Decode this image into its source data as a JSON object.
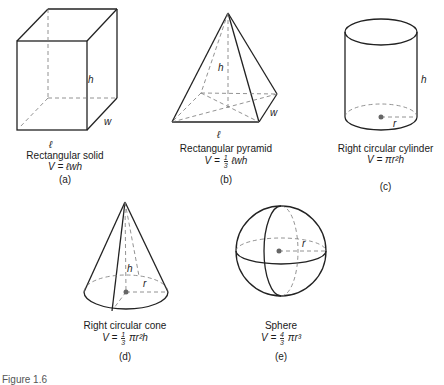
{
  "figure_caption": "Figure 1.6",
  "shapes": [
    {
      "id": "a",
      "name": "Rectangular solid",
      "formula": "V = ℓwh",
      "tag": "(a)",
      "dims": {
        "h": "h",
        "w": "w",
        "l": "ℓ"
      }
    },
    {
      "id": "b",
      "name": "Rectangular pyramid",
      "formula_prefix": "V =",
      "frac_num": "1",
      "frac_den": "3",
      "formula_suffix": "ℓwh",
      "tag": "(b)",
      "dims": {
        "h": "h",
        "w": "w",
        "l": "ℓ"
      }
    },
    {
      "id": "c",
      "name": "Right circular cylinder",
      "formula": "V = πr²h",
      "tag": "(c)",
      "dims": {
        "h": "h",
        "r": "r"
      }
    },
    {
      "id": "d",
      "name": "Right circular cone",
      "formula_prefix": "V =",
      "frac_num": "1",
      "frac_den": "3",
      "formula_suffix": "πr²h",
      "tag": "(d)",
      "dims": {
        "h": "h",
        "r": "r"
      }
    },
    {
      "id": "e",
      "name": "Sphere",
      "formula_prefix": "V =",
      "frac_num": "4",
      "frac_den": "3",
      "formula_suffix": "πr³",
      "tag": "(e)",
      "dims": {
        "r": "r"
      }
    }
  ]
}
